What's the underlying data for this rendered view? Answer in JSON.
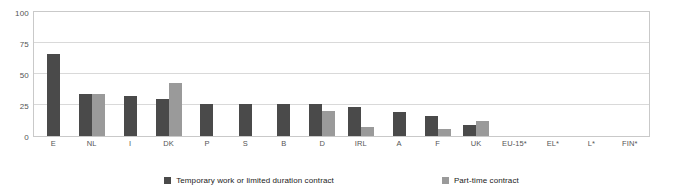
{
  "chart_data": {
    "type": "bar",
    "title": "",
    "subtitle": "",
    "xlabel": "",
    "ylabel": "",
    "ylim": [
      0,
      100
    ],
    "yticks": [
      0,
      25,
      50,
      75,
      100
    ],
    "grid": true,
    "legend_position": "bottom",
    "categories": [
      "E",
      "NL",
      "I",
      "DK",
      "P",
      "S",
      "B",
      "D",
      "IRL",
      "A",
      "F",
      "UK",
      "EU-15*",
      "EL*",
      "L*",
      "FIN*"
    ],
    "series": [
      {
        "name": "Temporary work or limited duration contract",
        "color": "#4a4a4a",
        "values": [
          66,
          34,
          32,
          30,
          26,
          26,
          26,
          26,
          23,
          19,
          16,
          9,
          null,
          null,
          null,
          null
        ]
      },
      {
        "name": "Part-time contract",
        "color": "#9a9a9a",
        "values": [
          null,
          34,
          null,
          43,
          null,
          null,
          null,
          20,
          7,
          null,
          6,
          12,
          null,
          null,
          null,
          null
        ]
      }
    ]
  },
  "axis": {
    "y_tick_labels": [
      "100",
      "75",
      "50",
      "25",
      "0"
    ]
  },
  "legend": {
    "items": [
      {
        "label": "Temporary work or limited duration contract",
        "color": "#4a4a4a",
        "swatch_name": "legend-swatch-temporary"
      },
      {
        "label": "Part-time contract",
        "color": "#9a9a9a",
        "swatch_name": "legend-swatch-parttime"
      }
    ]
  }
}
